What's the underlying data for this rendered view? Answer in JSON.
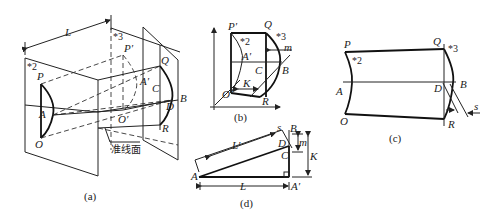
{
  "figure": {
    "panels": [
      {
        "id": "a",
        "caption": "(a)",
        "labels": {
          "L": "L",
          "star2": "*2",
          "star3": "*3",
          "P": "P",
          "A": "A",
          "O": "O",
          "Pp": "P′",
          "Ap": "A′",
          "Op": "O′",
          "Q": "Q",
          "C": "C",
          "D": "D",
          "B": "B",
          "R": "R",
          "plane": "准线面"
        }
      },
      {
        "id": "b",
        "caption": "(b)",
        "labels": {
          "Pp": "P′",
          "Q": "Q",
          "star2": "*2",
          "star3": "*3",
          "m": "m",
          "Ap": "A′",
          "C": "C",
          "B": "B",
          "Op": "O′",
          "K": "K",
          "R": "R"
        }
      },
      {
        "id": "c",
        "caption": "(c)",
        "labels": {
          "P": "P",
          "Q": "Q",
          "star2": "*2",
          "star3": "*3",
          "A": "A",
          "D": "D",
          "B": "B",
          "O": "O",
          "R": "R",
          "s": "s"
        }
      },
      {
        "id": "d",
        "caption": "(d)",
        "labels": {
          "Lp": "L′",
          "s": "s",
          "B": "B",
          "D": "D",
          "m": "m",
          "C": "C",
          "K": "K",
          "A": "A",
          "L": "L",
          "Ap": "A′"
        }
      }
    ]
  }
}
